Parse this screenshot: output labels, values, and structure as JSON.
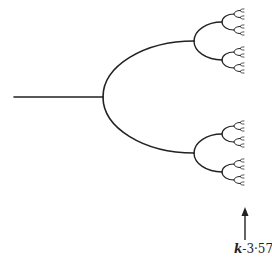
{
  "diagram": {
    "type": "bifurcation-tree",
    "stroke_color": "#222222",
    "background": "#ffffff",
    "stem": {
      "x1": 14,
      "x2": 103,
      "y": 97
    },
    "levels": [
      {
        "x_start": 103,
        "x_end": 194,
        "half_spread": 56
      },
      {
        "x_start": 194,
        "x_end": 222,
        "half_spread": 19
      },
      {
        "x_start": 222,
        "x_end": 234,
        "half_spread": 8
      },
      {
        "x_start": 234,
        "x_end": 240,
        "half_spread": 3.5
      },
      {
        "x_start": 240,
        "x_end": 244,
        "half_spread": 1.6
      }
    ],
    "arrow": {
      "x": 245,
      "y_tip": 207,
      "y_tail": 240
    },
    "annotation": {
      "variable": "k",
      "separator": "-",
      "value": "3·57",
      "full_text": "k-3·57"
    }
  }
}
